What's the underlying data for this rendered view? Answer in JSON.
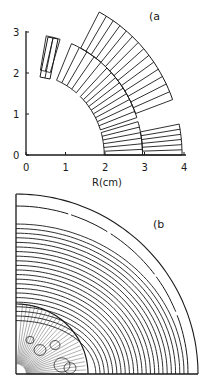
{
  "panel_a": {
    "label": "(a",
    "xlabel": "R(cm)",
    "x_ticks": [
      "0",
      "1",
      "2",
      "3",
      "4"
    ],
    "y_ticks": [
      "0",
      "1",
      "2",
      "3"
    ],
    "xlim": [
      0,
      4
    ],
    "ylim": [
      0,
      3
    ],
    "blocks": [
      {
        "name": "layer-outer-block-1",
        "r_in": 2.95,
        "r_out": 3.95,
        "ang_start": 0,
        "ang_end": 11,
        "count": 6
      },
      {
        "name": "layer-outer-block-2",
        "r_in": 2.95,
        "r_out": 3.95,
        "ang_start": 20,
        "ang_end": 62,
        "count": 14
      },
      {
        "name": "layer-inner-block-1",
        "r_in": 1.98,
        "r_out": 2.95,
        "ang_start": 0,
        "ang_end": 16,
        "count": 6
      },
      {
        "name": "layer-inner-block-2",
        "r_in": 1.98,
        "r_out": 2.95,
        "ang_start": 18,
        "ang_end": 46,
        "count": 9
      },
      {
        "name": "layer-inner-block-3",
        "r_in": 1.98,
        "r_out": 2.95,
        "ang_start": 50,
        "ang_end": 67,
        "count": 4
      },
      {
        "name": "layer-inner-block-4",
        "r_in": 2.1,
        "r_out": 2.95,
        "ang_start": 73,
        "ang_end": 80,
        "count": 2
      }
    ]
  },
  "panel_b": {
    "label": "(b",
    "description": "Field line contours of quadrant magnet cross-section"
  }
}
